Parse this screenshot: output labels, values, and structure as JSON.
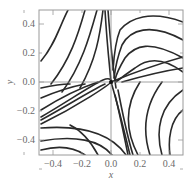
{
  "chart_data": {
    "type": "line",
    "subtype": "phase-portrait",
    "title": "",
    "xlabel": "x",
    "ylabel": "y",
    "xlim": [
      -0.5,
      0.5
    ],
    "ylim": [
      -0.5,
      0.5
    ],
    "x_ticks": [
      "-0.4",
      "-0.2",
      "0.0",
      "0.2",
      "0.4"
    ],
    "y_ticks": [
      "0.4",
      "0.2",
      "0.0",
      "-0.2",
      "-0.4"
    ],
    "grid": false,
    "zero_lines": true,
    "fixed_points": [
      {
        "x": 0.0,
        "y": 0.0,
        "kind": "saddle"
      }
    ],
    "separatrices": [
      {
        "from": [
          -0.5,
          -0.2
        ],
        "to": [
          0.5,
          0.2
        ]
      },
      {
        "from": [
          0.0,
          0.5
        ],
        "to": [
          0.18,
          -0.5
        ]
      }
    ],
    "trajectories_px": [
      "M41,61 C55,45 60,25 68,10",
      "M51,84 C70,60 78,35 85,10",
      "M62,92 C82,65 90,35 97,10",
      "M80,88 C96,60 100,35 103,10",
      "M105,10 C107,45 110,70 111,82",
      "M108,10 C111,50 114,75 116,88",
      "M183,22 C150,10 130,18 120,30 C116,40 114,55 113,70",
      "M183,40 C150,22 130,30 122,45 C117,58 115,70 114,78",
      "M183,58 C150,40 135,45 125,58 C119,68 116,75 115,80",
      "M183,72 C160,55 145,60 135,68 C125,75 118,80 116,82",
      "M41,124 C80,105 110,84 111,82 C140,70 165,62 183,57",
      "M41,117 C70,100 90,86 103,80 C110,77 112,80 112,83",
      "M41,120 C70,104 92,90 105,84",
      "M41,110 C60,98 80,88 98,82",
      "M41,98 C55,92 70,87 85,84",
      "M41,88 C50,86 60,84 70,84",
      "M41,128 C80,125 110,132 126,155",
      "M41,141 C75,135 100,140 112,155",
      "M41,150 C60,145 75,148 85,155",
      "M111,82 C118,105 124,130 130,155",
      "M115,95 C120,115 124,135 128,155",
      "M118,90 C122,110 126,132 133,155",
      "M140,82 C125,105 125,130 138,155",
      "M162,82 C145,105 142,130 150,155",
      "M183,90 C160,105 155,130 162,155",
      "M183,110 C170,120 168,140 170,155",
      "M98,155 C90,140 80,130 70,125",
      "M122,82 C150,74 170,70 183,68"
    ]
  }
}
